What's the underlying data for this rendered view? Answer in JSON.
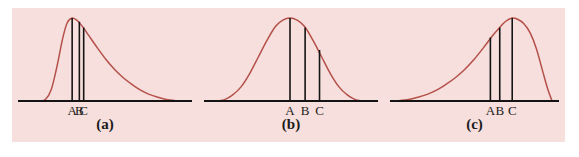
{
  "figure": {
    "background_color": "#f6dfdc",
    "page_color": "#ffffff",
    "curve_color": "#b5504a",
    "axis_color": "#141414",
    "tick_color": "#141414"
  },
  "chart_data": {
    "type": "line",
    "title": "",
    "xlabel": "",
    "ylabel": "",
    "grid": false,
    "legend": "none",
    "panels": [
      {
        "id": "a",
        "caption": "(a)",
        "shape": "right-skewed",
        "axis": {
          "x_start": 18,
          "x_end": 190,
          "y": 101
        },
        "curve_peak_x": 0.265,
        "curve": {
          "x": [
            0.0,
            0.04,
            0.08,
            0.12,
            0.16,
            0.2,
            0.23,
            0.265,
            0.3,
            0.34,
            0.38,
            0.44,
            0.5,
            0.56,
            0.62,
            0.68,
            0.74,
            0.8,
            0.86,
            0.92,
            1.0
          ],
          "y": [
            0.0,
            0.0,
            0.02,
            0.14,
            0.42,
            0.76,
            0.94,
            1.0,
            0.97,
            0.89,
            0.79,
            0.64,
            0.5,
            0.38,
            0.28,
            0.2,
            0.13,
            0.08,
            0.045,
            0.018,
            0.0
          ]
        },
        "marks": [
          {
            "label": "A",
            "x": 0.265,
            "height": 1.0
          },
          {
            "label": "B",
            "x": 0.315,
            "height": 0.955
          },
          {
            "label": "C",
            "x": 0.345,
            "height": 0.885
          }
        ]
      },
      {
        "id": "b",
        "caption": "(b)",
        "shape": "symmetric",
        "axis": {
          "x_start": 198,
          "x_end": 370,
          "y": 101
        },
        "curve_peak_x": 0.5,
        "curve": {
          "x": [
            0.0,
            0.05,
            0.1,
            0.16,
            0.22,
            0.28,
            0.34,
            0.4,
            0.45,
            0.5,
            0.55,
            0.6,
            0.66,
            0.72,
            0.78,
            0.84,
            0.9,
            0.95,
            1.0
          ],
          "y": [
            0.0,
            0.02,
            0.07,
            0.17,
            0.33,
            0.53,
            0.73,
            0.9,
            0.975,
            1.0,
            0.975,
            0.9,
            0.73,
            0.53,
            0.33,
            0.17,
            0.07,
            0.02,
            0.0
          ]
        },
        "marks": [
          {
            "label": "A",
            "x": 0.5,
            "height": 1.0
          },
          {
            "label": "B",
            "x": 0.605,
            "height": 0.885
          },
          {
            "label": "C",
            "x": 0.705,
            "height": 0.615
          }
        ]
      },
      {
        "id": "c",
        "caption": "(c)",
        "shape": "left-skewed",
        "axis": {
          "x_start": 378,
          "x_end": 552,
          "y": 101
        },
        "curve_peak_x": 0.745,
        "curve": {
          "x": [
            0.0,
            0.08,
            0.14,
            0.2,
            0.26,
            0.32,
            0.38,
            0.44,
            0.5,
            0.56,
            0.62,
            0.66,
            0.7,
            0.745,
            0.78,
            0.82,
            0.86,
            0.9,
            0.94,
            0.97,
            1.0
          ],
          "y": [
            0.0,
            0.018,
            0.045,
            0.08,
            0.13,
            0.2,
            0.28,
            0.38,
            0.5,
            0.64,
            0.79,
            0.875,
            0.955,
            1.0,
            0.985,
            0.93,
            0.82,
            0.63,
            0.36,
            0.16,
            0.0
          ]
        },
        "marks": [
          {
            "label": "A",
            "x": 0.605,
            "height": 0.765
          },
          {
            "label": "B",
            "x": 0.665,
            "height": 0.885
          },
          {
            "label": "C",
            "x": 0.745,
            "height": 1.0
          }
        ]
      }
    ]
  }
}
